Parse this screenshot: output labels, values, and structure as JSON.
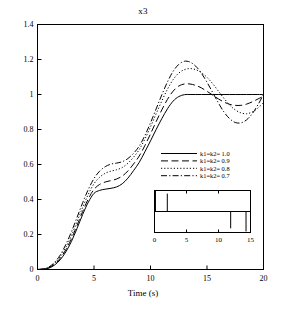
{
  "chart_data": {
    "type": "line",
    "title": "x3",
    "xlabel": "Time (s)",
    "ylabel": "",
    "xlim": [
      0,
      20
    ],
    "ylim": [
      0,
      1.4
    ],
    "xticks": [
      0,
      5,
      10,
      15,
      20
    ],
    "xtick_labels": [
      "0",
      "5",
      "10",
      "15",
      "20"
    ],
    "yticks": [
      0,
      0.2,
      0.4,
      0.6,
      0.8,
      1,
      1.2,
      1.4
    ],
    "ytick_labels": [
      "0",
      "0.2",
      "0.4",
      "0.6",
      "0.8",
      "1",
      "1.2",
      "1.4"
    ],
    "grid": false,
    "legend_position": "center-right",
    "x": [
      0,
      0.5,
      1,
      1.5,
      2,
      2.5,
      3,
      3.5,
      4,
      4.5,
      5,
      5.5,
      6,
      6.5,
      7,
      7.5,
      8,
      8.5,
      9,
      9.5,
      10,
      10.5,
      11,
      11.5,
      12,
      12.5,
      13,
      13.5,
      14,
      14.5,
      15,
      15.5,
      16,
      16.5,
      17,
      17.5,
      18,
      18.5,
      19,
      19.5,
      20
    ],
    "series": [
      {
        "name": "k1=k2= 1.0",
        "style": "solid",
        "color": "#000000",
        "values": [
          0,
          0.002,
          0.008,
          0.025,
          0.055,
          0.1,
          0.16,
          0.235,
          0.315,
          0.385,
          0.435,
          0.452,
          0.459,
          0.464,
          0.472,
          0.49,
          0.522,
          0.565,
          0.612,
          0.672,
          0.735,
          0.8,
          0.862,
          0.918,
          0.962,
          0.988,
          0.999,
          1.0,
          1.0,
          1.0,
          1.0,
          1.0,
          1.0,
          1.0,
          1.0,
          1.0,
          1.0,
          1.0,
          1.0,
          1.0,
          1.0
        ]
      },
      {
        "name": "k1=k2= 0.9",
        "style": "dashed",
        "color": "#000000",
        "values": [
          0,
          0.002,
          0.01,
          0.03,
          0.063,
          0.112,
          0.175,
          0.252,
          0.332,
          0.404,
          0.458,
          0.486,
          0.5,
          0.508,
          0.517,
          0.534,
          0.563,
          0.603,
          0.648,
          0.708,
          0.775,
          0.845,
          0.912,
          0.972,
          1.019,
          1.048,
          1.06,
          1.06,
          1.052,
          1.038,
          1.018,
          0.997,
          0.975,
          0.957,
          0.944,
          0.938,
          0.938,
          0.945,
          0.958,
          0.974,
          0.99
        ]
      },
      {
        "name": "k1=k2= 0.8",
        "style": "dotted",
        "color": "#000000",
        "values": [
          0,
          0.003,
          0.012,
          0.035,
          0.072,
          0.126,
          0.194,
          0.274,
          0.356,
          0.43,
          0.49,
          0.527,
          0.55,
          0.562,
          0.57,
          0.583,
          0.607,
          0.642,
          0.685,
          0.745,
          0.815,
          0.89,
          0.963,
          1.03,
          1.085,
          1.122,
          1.142,
          1.148,
          1.142,
          1.125,
          1.098,
          1.062,
          1.02,
          0.978,
          0.94,
          0.912,
          0.895,
          0.89,
          0.9,
          0.922,
          0.953
        ]
      },
      {
        "name": "k1=k2= 0.7",
        "style": "dashdot",
        "color": "#000000",
        "values": [
          0,
          0.003,
          0.014,
          0.04,
          0.082,
          0.142,
          0.215,
          0.298,
          0.382,
          0.458,
          0.52,
          0.562,
          0.588,
          0.602,
          0.608,
          0.616,
          0.634,
          0.664,
          0.705,
          0.765,
          0.838,
          0.918,
          0.998,
          1.072,
          1.132,
          1.172,
          1.19,
          1.185,
          1.162,
          1.122,
          1.07,
          1.012,
          0.953,
          0.9,
          0.862,
          0.84,
          0.838,
          0.855,
          0.89,
          0.94,
          1.0
        ]
      }
    ],
    "inset": {
      "type": "line",
      "xlim": [
        0,
        15
      ],
      "ylim": [
        -1,
        1
      ],
      "xticks": [
        0,
        5,
        10,
        15
      ],
      "xtick_labels": [
        "0",
        "5",
        "10",
        "15"
      ],
      "baseline": 0,
      "spikes": [
        {
          "x": 0.15,
          "height": 1.0
        },
        {
          "x": 2.0,
          "height": 0.85
        },
        {
          "x": 11.9,
          "height": -0.8
        },
        {
          "x": 14.3,
          "height": -0.95
        }
      ]
    }
  }
}
